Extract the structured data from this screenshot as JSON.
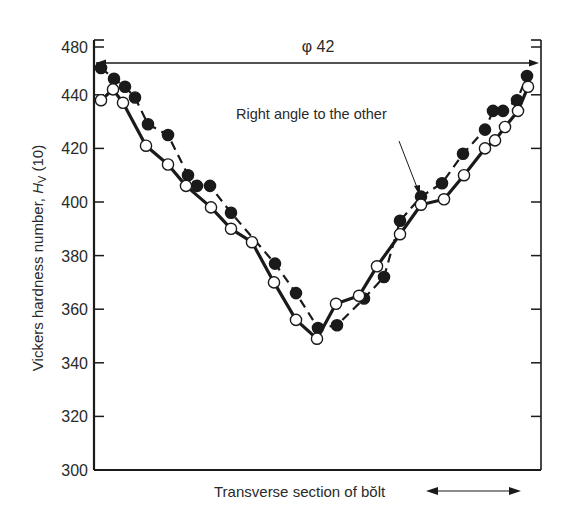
{
  "chart_data": {
    "type": "line",
    "title": "",
    "xlabel": "Transverse section of bolt",
    "ylabel": "Vickers hardness number, Hv (10)",
    "ylabel_parts": {
      "main": "Vickers hardness number, ",
      "symbol": "H",
      "subscript": "V",
      "suffix": " (10)"
    },
    "ylim": [
      300,
      460
    ],
    "yticks": [
      300,
      320,
      340,
      360,
      380,
      400,
      420,
      440,
      480
    ],
    "ytick_positions": [
      300,
      320,
      340,
      360,
      380,
      400,
      420,
      440,
      458
    ],
    "x_extent_label": "φ 42",
    "x_positions_note": "x in pixels across bolt section, left axis=94, right axis=541",
    "grid": false,
    "legend": null,
    "annotations": [
      {
        "text": "Right angle to the other",
        "points_to": "dashed series (filled circles)"
      }
    ],
    "series": [
      {
        "name": "Filled circles (right angle to the other)",
        "line_style": "dashed",
        "marker": "filled-circle",
        "x": [
          101,
          114,
          125,
          135,
          148,
          168,
          188,
          197,
          210,
          231,
          275,
          296,
          318,
          337,
          364,
          384,
          400,
          421,
          442,
          463,
          485,
          493,
          503,
          517,
          527
        ],
        "values": [
          450,
          446,
          443,
          439,
          429,
          425,
          410,
          406,
          406,
          396,
          377,
          366,
          353,
          354,
          364,
          372,
          393,
          402,
          407,
          418,
          427,
          434,
          434,
          438,
          447
        ]
      },
      {
        "name": "Open circles",
        "line_style": "solid",
        "marker": "open-circle",
        "x": [
          101,
          113,
          123,
          146,
          168,
          186,
          211,
          231,
          252,
          274,
          296,
          317,
          336,
          359,
          377,
          400,
          421,
          444,
          464,
          485,
          495,
          505,
          518,
          528
        ],
        "values": [
          438,
          442,
          437,
          421,
          414,
          406,
          398,
          390,
          385,
          370,
          356,
          349,
          362,
          365,
          376,
          388,
          399,
          401,
          410,
          420,
          423,
          428,
          434,
          443
        ]
      }
    ]
  },
  "labels": {
    "diameter": "φ 42",
    "annotation": "Right angle to the other",
    "xlabel": "Transverse section of bŏlt",
    "ylabel_main": "Vickers hardness number, ",
    "ylabel_symbol": "H",
    "ylabel_sub": "V",
    "ylabel_suffix": " (10)"
  },
  "colors": {
    "ink": "#1a1a1a",
    "background": "#ffffff"
  }
}
